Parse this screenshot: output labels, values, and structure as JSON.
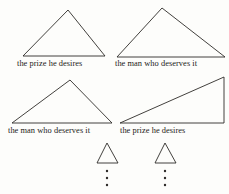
{
  "figure": {
    "background_color": "#fdfdfb",
    "ink_color": "#2e2b28",
    "stroke_width": 0.9,
    "captions": {
      "row1_left": "the prize he desires",
      "row1_right": "the man who deserves it",
      "row2_left": "the man who deserves it",
      "row2_right": "the prize he desires"
    },
    "shapes": [
      {
        "name": "triangle-row1-left",
        "kind": "isoceles-triangle",
        "points": "23,56 68,10 105,56"
      },
      {
        "name": "triangle-row1-right",
        "kind": "isoceles-triangle",
        "points": "117,57 162,8 225,57"
      },
      {
        "name": "triangle-row2-left",
        "kind": "obtuse-triangle",
        "points": "12,123 70,80 112,123"
      },
      {
        "name": "triangle-row2-right",
        "kind": "right-triangle",
        "points": "120,123 224,77 224,123"
      },
      {
        "name": "triangle-small-left",
        "kind": "isoceles-triangle",
        "points": "97,163 107,143 118,163"
      },
      {
        "name": "triangle-small-right",
        "kind": "isoceles-triangle",
        "points": "155,163 165,143 176,163"
      }
    ],
    "ellipses": [
      {
        "name": "vertical-ellipsis-left",
        "x": 107,
        "dot_radius": 1.2,
        "dot_ys": [
          171,
          178,
          185
        ]
      },
      {
        "name": "vertical-ellipsis-right",
        "x": 165,
        "dot_radius": 1.2,
        "dot_ys": [
          171,
          178,
          185
        ]
      }
    ]
  }
}
